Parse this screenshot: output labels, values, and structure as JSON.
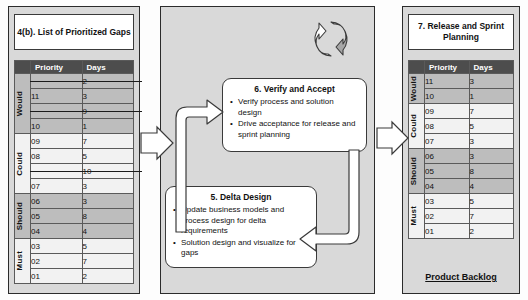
{
  "diagram": {
    "left_panel": {
      "heading": "4(b). List of Prioritized Gaps",
      "table": {
        "columns": [
          "",
          "Priority",
          "Days"
        ],
        "groups": [
          {
            "category": "Would",
            "shade": "dark",
            "rows": [
              {
                "priority": "",
                "days": "2",
                "struck": true
              },
              {
                "priority": "11",
                "days": "3",
                "struck": false
              },
              {
                "priority": "",
                "days": "9",
                "struck": true
              },
              {
                "priority": "10",
                "days": "1",
                "struck": false
              }
            ]
          },
          {
            "category": "Could",
            "shade": "light",
            "rows": [
              {
                "priority": "09",
                "days": "7",
                "struck": false
              },
              {
                "priority": "08",
                "days": "5",
                "struck": false
              },
              {
                "priority": "",
                "days": "10",
                "struck": true
              },
              {
                "priority": "07",
                "days": "3",
                "struck": false
              }
            ]
          },
          {
            "category": "Should",
            "shade": "dark",
            "rows": [
              {
                "priority": "06",
                "days": "3",
                "struck": false
              },
              {
                "priority": "05",
                "days": "8",
                "struck": false
              },
              {
                "priority": "04",
                "days": "4",
                "struck": false
              }
            ]
          },
          {
            "category": "Must",
            "shade": "light",
            "rows": [
              {
                "priority": "03",
                "days": "5",
                "struck": false
              },
              {
                "priority": "02",
                "days": "7",
                "struck": false
              },
              {
                "priority": "01",
                "days": "2",
                "struck": false
              }
            ]
          }
        ]
      }
    },
    "middle_panel": {
      "loop_icon": "circular-arrows-icon",
      "boxes": [
        {
          "id": "box6",
          "heading": "6. Verify and Accept",
          "bullets": [
            "Verify process and solution design",
            "Drive acceptance for release and sprint planning"
          ]
        },
        {
          "id": "box5",
          "heading": "5. Delta Design",
          "bullets": [
            "Update business models and process design for delta requirements",
            "Solution design and visualize for gaps"
          ]
        }
      ]
    },
    "right_panel": {
      "heading": "7. Release and Sprint Planning",
      "footer": "Product Backlog",
      "table": {
        "columns": [
          "",
          "Priority",
          "Days"
        ],
        "groups": [
          {
            "category": "Would",
            "shade": "dark",
            "rows": [
              {
                "priority": "11",
                "days": "3"
              },
              {
                "priority": "10",
                "days": "1"
              }
            ]
          },
          {
            "category": "Could",
            "shade": "light",
            "rows": [
              {
                "priority": "09",
                "days": "7"
              },
              {
                "priority": "08",
                "days": "5"
              },
              {
                "priority": "07",
                "days": "3"
              }
            ]
          },
          {
            "category": "Should",
            "shade": "dark",
            "rows": [
              {
                "priority": "06",
                "days": "3"
              },
              {
                "priority": "05",
                "days": "8"
              },
              {
                "priority": "04",
                "days": "4"
              }
            ]
          },
          {
            "category": "Must",
            "shade": "light",
            "rows": [
              {
                "priority": "03",
                "days": "5"
              },
              {
                "priority": "02",
                "days": "7"
              },
              {
                "priority": "01",
                "days": "2"
              }
            ]
          }
        ]
      }
    },
    "connectors": [
      {
        "name": "arrow-left-to-middle",
        "type": "block-arrow-right"
      },
      {
        "name": "arrow-middle-to-right",
        "type": "block-arrow-right"
      },
      {
        "name": "arrow-delta-to-verify",
        "type": "loop-arrow-up"
      },
      {
        "name": "arrow-verify-to-delta",
        "type": "loop-arrow-down"
      }
    ],
    "colors": {
      "panel_bg": "#d9d9d9",
      "header_bg": "#4d4d4d",
      "band_dark": "#bdbdbd",
      "band_light": "#f2f2f2",
      "outline": "#3a3a3a",
      "text": "#111111"
    }
  }
}
